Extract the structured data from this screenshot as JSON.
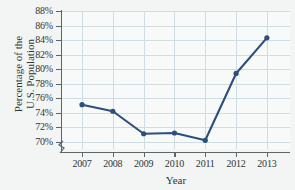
{
  "figure": {
    "title_cropped": "",
    "background_color": "#f2f5f4",
    "plot_background_color": "#f7faf9",
    "gridline_color": "#cfdde3",
    "axis_color": "#5d6567",
    "series_color": "#2d4f7c"
  },
  "axis": {
    "y_title_line1": "Percentage of the",
    "y_title_line2": "U.S. Population",
    "x_title": "Year",
    "y_tick_labels": [
      "88%",
      "86%",
      "84%",
      "82%",
      "80%",
      "78%",
      "76%",
      "74%",
      "72%",
      "70%"
    ],
    "x_tick_labels": [
      "2007",
      "2008",
      "2009",
      "2010",
      "2011",
      "2012",
      "2013"
    ],
    "y_axis_break_symbol": "axis-break"
  },
  "chart_data": {
    "type": "line",
    "title": "",
    "xlabel": "Year",
    "ylabel": "Percentage of the U.S. Population",
    "categories": [
      "2007",
      "2008",
      "2009",
      "2010",
      "2011",
      "2012",
      "2013"
    ],
    "x": [
      2007,
      2008,
      2009,
      2010,
      2011,
      2012,
      2013
    ],
    "values": [
      75.1,
      74.2,
      71.1,
      71.2,
      70.2,
      79.4,
      84.3
    ],
    "series": [
      {
        "name": "Percentage of the U.S. Population",
        "values": [
          75.1,
          74.2,
          71.1,
          71.2,
          70.2,
          79.4,
          84.3
        ],
        "color": "#2d4f7c",
        "marker": "circle"
      }
    ],
    "ylim": [
      69.0,
      88.0
    ],
    "ytick_values": [
      88,
      86,
      84,
      82,
      80,
      78,
      76,
      74,
      72,
      70
    ],
    "ytick_suffix": "%",
    "xlim": [
      2006.35,
      2013.75
    ],
    "grid": true,
    "grid_axes": "both",
    "legend": false,
    "legend_position": "none",
    "y_axis_broken": true
  }
}
